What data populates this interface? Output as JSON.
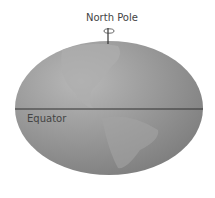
{
  "diagram": {
    "labels": {
      "north_pole": "North Pole",
      "equator": "Equator"
    },
    "colors": {
      "globe_light": "#b5b5b5",
      "globe_dark": "#8e8e8e",
      "land": "#a9a9a9",
      "line": "#333333"
    }
  }
}
